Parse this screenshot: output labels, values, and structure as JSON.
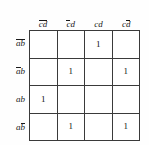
{
  "diagram": {
    "type": "karnaugh-map",
    "variables": [
      "a",
      "b",
      "c",
      "d"
    ],
    "row_variables": "ab",
    "col_variables": "cd"
  },
  "columns": [
    {
      "id": "col-0",
      "label": "c̄d̄",
      "c": "c-bar",
      "d": "d-bar",
      "parts": [
        {
          "t": "c",
          "bar": true
        },
        {
          "t": "d",
          "bar": true
        }
      ]
    },
    {
      "id": "col-1",
      "label": "c̄d",
      "c": "c-bar",
      "d": "d",
      "parts": [
        {
          "t": "c",
          "bar": true
        },
        {
          "t": "d",
          "bar": false
        }
      ]
    },
    {
      "id": "col-2",
      "label": "cd",
      "c": "c",
      "d": "d",
      "parts": [
        {
          "t": "c",
          "bar": false
        },
        {
          "t": "d",
          "bar": false
        }
      ]
    },
    {
      "id": "col-3",
      "label": "cd̄",
      "c": "c",
      "d": "d-bar",
      "parts": [
        {
          "t": "c",
          "bar": false
        },
        {
          "t": "d",
          "bar": true
        }
      ]
    }
  ],
  "rows": [
    {
      "id": "row-0",
      "label": "āb̄",
      "a": "a-bar",
      "b": "b-bar",
      "parts": [
        {
          "t": "a",
          "bar": true
        },
        {
          "t": "b",
          "bar": true
        }
      ]
    },
    {
      "id": "row-1",
      "label": "āb",
      "a": "a-bar",
      "b": "b",
      "parts": [
        {
          "t": "a",
          "bar": true
        },
        {
          "t": "b",
          "bar": false
        }
      ]
    },
    {
      "id": "row-2",
      "label": "ab",
      "a": "a",
      "b": "b",
      "parts": [
        {
          "t": "a",
          "bar": false
        },
        {
          "t": "b",
          "bar": false
        }
      ]
    },
    {
      "id": "row-3",
      "label": "ab̄",
      "a": "a",
      "b": "b-bar",
      "parts": [
        {
          "t": "a",
          "bar": false
        },
        {
          "t": "b",
          "bar": true
        }
      ]
    }
  ],
  "cells": [
    [
      "",
      "",
      "1",
      ""
    ],
    [
      "",
      "1",
      "",
      "1"
    ],
    [
      "1",
      "",
      "",
      ""
    ],
    [
      "",
      "1",
      "",
      "1"
    ]
  ],
  "colors": {
    "background": "#fefefe",
    "grid_line": "#3a3a3a",
    "text": "#1a1a1a",
    "cell_fill": "#ffffff"
  }
}
